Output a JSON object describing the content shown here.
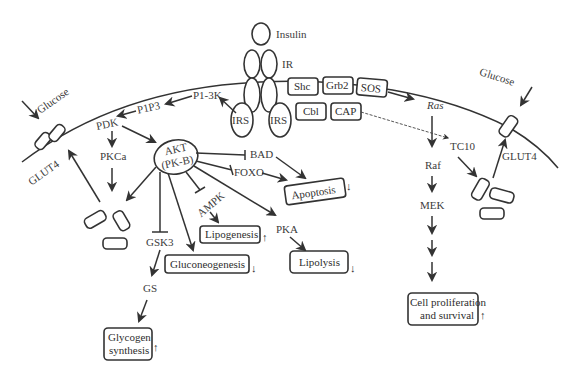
{
  "diagram": {
    "labels": {
      "insulin": "Insulin",
      "ir": "IR",
      "irs_left": "IRS",
      "irs_right": "IRS",
      "shc": "Shc",
      "grb2": "Grb2",
      "sos": "SOS",
      "cbl": "Cbl",
      "cap": "CAP",
      "pi3k": "P1-3K",
      "pip3": "P1P3",
      "pdk": "PDK",
      "pkca": "PKCa",
      "akt_line1": "AKT",
      "akt_line2": "(PK-B)",
      "bad": "BAD",
      "foxo": "FOXO",
      "ampk": "AMPK",
      "pka": "PKA",
      "gsk3": "GSK3",
      "gs": "GS",
      "ras": "Ras",
      "raf": "Raf",
      "mek": "MEK",
      "tc10": "TC10",
      "glucose_left": "Glucose",
      "glucose_right": "Glucose",
      "glut4_left": "GLUT4",
      "glut4_right": "GLUT4"
    },
    "outcomes": [
      {
        "id": "apoptosis",
        "label": "Apoptosis",
        "direction": "down"
      },
      {
        "id": "lipogenesis",
        "label": "Lipogenesis",
        "direction": "up"
      },
      {
        "id": "gluconeogenesis",
        "label": "Gluconeogenesis",
        "direction": "down"
      },
      {
        "id": "lipolysis",
        "label": "Lipolysis",
        "direction": "down"
      },
      {
        "id": "glycogen",
        "label_line1": "Glycogen",
        "label_line2": "synthesis",
        "direction": "up"
      },
      {
        "id": "cell_prolif",
        "label_line1": "Cell proliferation",
        "label_line2": "and survival",
        "direction": "up"
      }
    ],
    "arrow_glyphs": {
      "up": "↑",
      "down": "↓"
    },
    "edges": [
      {
        "from": "IRS",
        "to": "P1-3K",
        "type": "activate"
      },
      {
        "from": "P1-3K",
        "to": "P1P3",
        "type": "activate"
      },
      {
        "from": "P1P3",
        "to": "PDK",
        "type": "activate"
      },
      {
        "from": "PDK",
        "to": "PKCa",
        "type": "activate"
      },
      {
        "from": "PDK",
        "to": "AKT",
        "type": "activate"
      },
      {
        "from": "AKT",
        "to": "BAD",
        "type": "inhibit"
      },
      {
        "from": "AKT",
        "to": "FOXO",
        "type": "inhibit"
      },
      {
        "from": "AKT",
        "to": "AMPK",
        "type": "inhibit"
      },
      {
        "from": "AKT",
        "to": "PKA",
        "type": "activate"
      },
      {
        "from": "AKT",
        "to": "GSK3",
        "type": "inhibit"
      },
      {
        "from": "AKT",
        "to": "Gluconeogenesis",
        "type": "activate"
      },
      {
        "from": "AKT",
        "to": "GLUT4 vesicles",
        "type": "activate"
      },
      {
        "from": "BAD",
        "to": "Apoptosis",
        "type": "activate"
      },
      {
        "from": "FOXO",
        "to": "Apoptosis",
        "type": "activate"
      },
      {
        "from": "AMPK",
        "to": "Lipogenesis",
        "type": "activate"
      },
      {
        "from": "PKA",
        "to": "Lipolysis",
        "type": "activate"
      },
      {
        "from": "GSK3",
        "to": "GS",
        "type": "activate"
      },
      {
        "from": "GS",
        "to": "Glycogen synthesis",
        "type": "activate"
      },
      {
        "from": "SOS",
        "to": "Ras",
        "type": "activate"
      },
      {
        "from": "Ras",
        "to": "Raf",
        "type": "activate"
      },
      {
        "from": "Raf",
        "to": "MEK",
        "type": "activate"
      },
      {
        "from": "MEK",
        "to": "Cell proliferation and survival",
        "type": "activate"
      },
      {
        "from": "CAP",
        "to": "TC10",
        "type": "dashed"
      },
      {
        "from": "TC10",
        "to": "GLUT4 vesicles",
        "type": "activate"
      },
      {
        "from": "GLUT4 vesicles",
        "to": "GLUT4 membrane",
        "type": "activate"
      }
    ]
  }
}
